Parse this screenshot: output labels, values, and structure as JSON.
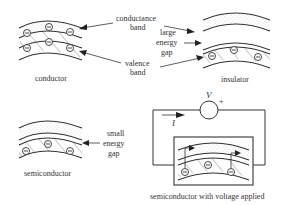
{
  "diagram": {
    "type": "band theory of solids",
    "panels": {
      "conductor": {
        "caption": "conductor",
        "conduction_electrons": 3,
        "valence_electrons": 3
      },
      "insulator": {
        "caption": "insulator",
        "valence_electrons": 3
      },
      "semiconductor": {
        "caption": "semiconductor",
        "valence_electrons": 3
      },
      "semiconductor_voltage": {
        "caption": "semiconductor with voltage applied",
        "voltage_label": "V",
        "polarity_label": "+",
        "current_label": "I",
        "valence_electrons": 3,
        "excited_arrows": 2
      }
    },
    "annotations": {
      "conductance_band": [
        "conductance",
        "band"
      ],
      "valence_band": [
        "valence",
        "band"
      ],
      "large_energy_gap": [
        "large",
        "energy",
        "gap"
      ],
      "small_energy_gap": [
        "small",
        "energy",
        "gap"
      ]
    },
    "colors": {
      "line": "#333333",
      "dots": "#c8c8c8",
      "background": "#ffffff"
    }
  }
}
